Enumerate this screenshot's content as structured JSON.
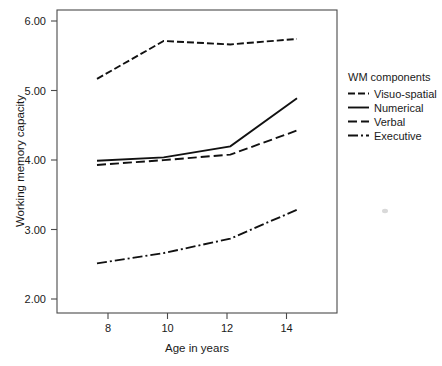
{
  "chart_data": {
    "type": "line",
    "title": "",
    "xlabel": "Age in years",
    "ylabel": "Working memory capacity",
    "x": [
      8,
      10,
      12,
      14
    ],
    "xtick_labels": [
      "8",
      "10",
      "12",
      "14"
    ],
    "ytick_labels": [
      "2.00",
      "3.00",
      "4.00",
      "5.00",
      "6.00"
    ],
    "ytick_values": [
      2.0,
      3.0,
      4.0,
      5.0,
      6.0
    ],
    "xlim": [
      6.8,
      15.2
    ],
    "ylim": [
      1.8,
      6.2
    ],
    "grid": false,
    "legend_position": "right",
    "legend_title": "WM components",
    "series": [
      {
        "name": "Visuo-spatial",
        "style": "dashed",
        "dasharray": "7,3",
        "values": [
          5.2,
          5.75,
          5.7,
          5.78
        ]
      },
      {
        "name": "Numerical",
        "style": "solid",
        "dasharray": "none",
        "values": [
          4.01,
          4.06,
          4.22,
          4.92
        ]
      },
      {
        "name": "Verbal",
        "style": "dashed",
        "dasharray": "9,4",
        "values": [
          3.95,
          4.02,
          4.1,
          4.45
        ]
      },
      {
        "name": "Executive",
        "style": "dash-dot",
        "dasharray": "10,3,2,3",
        "values": [
          2.52,
          2.67,
          2.88,
          3.3
        ]
      }
    ]
  },
  "axes": {
    "y_title": "Working memory capacity",
    "x_title": "Age in years",
    "y_ticks": [
      {
        "label": "6.00",
        "value": 6.0
      },
      {
        "label": "5.00",
        "value": 5.0
      },
      {
        "label": "4.00",
        "value": 4.0
      },
      {
        "label": "3.00",
        "value": 3.0
      },
      {
        "label": "2.00",
        "value": 2.0
      }
    ],
    "x_ticks": [
      {
        "label": "8",
        "value": 8
      },
      {
        "label": "10",
        "value": 10
      },
      {
        "label": "12",
        "value": 12
      },
      {
        "label": "14",
        "value": 14
      }
    ]
  },
  "legend": {
    "title": "WM components",
    "items": [
      {
        "label": "Visuo-spatial",
        "dasharray": "7,3"
      },
      {
        "label": "Numerical",
        "dasharray": "none"
      },
      {
        "label": "Verbal",
        "dasharray": "9,4"
      },
      {
        "label": "Executive",
        "dasharray": "10,3,2,3"
      }
    ]
  },
  "colors": {
    "ink": "#111111",
    "frame": "#4a4a4a",
    "background": "#ffffff"
  }
}
